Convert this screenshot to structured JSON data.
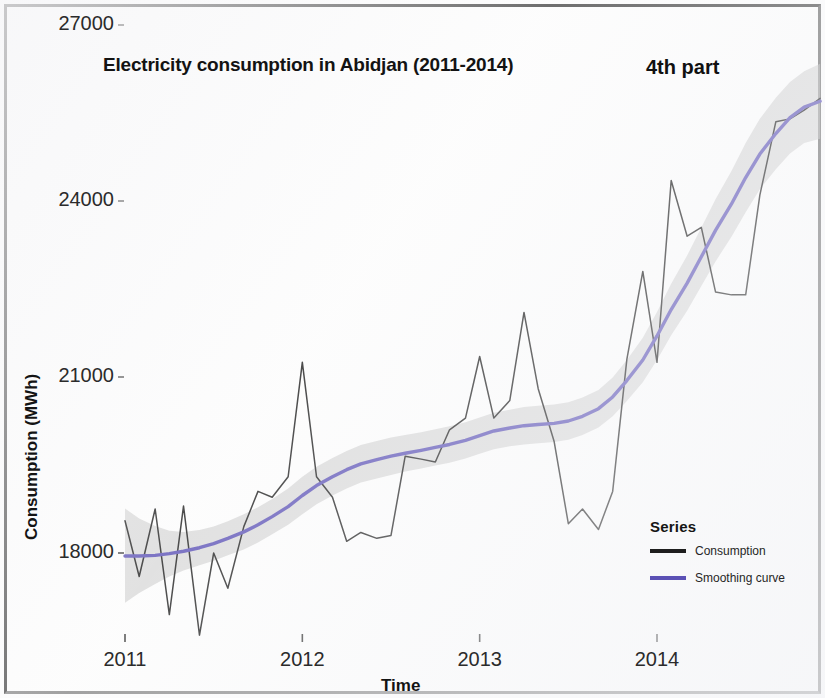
{
  "chart_data": {
    "type": "line",
    "title": "Electricity consumption in Abidjan (2011-2014)",
    "annotation": "4th part",
    "xlabel": "Time",
    "ylabel": "Consumption (MWh)",
    "xlim": [
      2011.0,
      2014.95
    ],
    "ylim": [
      16800,
      27000
    ],
    "xticks": [
      2011,
      2012,
      2013,
      2014
    ],
    "xtick_labels": [
      "2011",
      "2012",
      "2013",
      "2014"
    ],
    "yticks": [
      18000,
      21000,
      24000,
      27000
    ],
    "ytick_labels": [
      "18000",
      "21000",
      "24000",
      "27000"
    ],
    "grid": false,
    "legend": {
      "title": "Series",
      "position": "bottom-right",
      "entries": [
        {
          "label": "Consumption",
          "color": "#1e1e1e"
        },
        {
          "label": "Smoothing curve",
          "color": "#5b51b5"
        }
      ]
    },
    "confidence_band": {
      "label": "smoothing confidence interval",
      "color": "#bdbdbd",
      "opacity": 0.55
    },
    "x": [
      2011.0,
      2011.08,
      2011.17,
      2011.25,
      2011.33,
      2011.42,
      2011.5,
      2011.58,
      2011.67,
      2011.75,
      2011.83,
      2011.92,
      2012.0,
      2012.08,
      2012.17,
      2012.25,
      2012.33,
      2012.42,
      2012.5,
      2012.58,
      2012.67,
      2012.75,
      2012.83,
      2012.92,
      2013.0,
      2013.08,
      2013.17,
      2013.25,
      2013.33,
      2013.42,
      2013.5,
      2013.58,
      2013.67,
      2013.75,
      2013.83,
      2013.92,
      2014.0,
      2014.08,
      2014.17,
      2014.25,
      2014.33,
      2014.42,
      2014.5,
      2014.58,
      2014.67,
      2014.75,
      2014.83,
      2014.92
    ],
    "series": [
      {
        "name": "Consumption",
        "color": "#1e1e1e",
        "values": [
          18550,
          17600,
          18750,
          16950,
          18800,
          16600,
          18000,
          17400,
          18450,
          19050,
          18950,
          19300,
          21250,
          19300,
          18950,
          18200,
          18350,
          18250,
          18300,
          19650,
          19600,
          19550,
          20100,
          20300,
          21350,
          20300,
          20600,
          22100,
          20800,
          19900,
          18500,
          18750,
          18400,
          19050,
          21300,
          22800,
          21250,
          24350,
          23400,
          23550,
          22450,
          22400,
          22400,
          24100,
          25350,
          25400,
          25550,
          25750
        ]
      },
      {
        "name": "Smoothing curve",
        "color": "#5b51b5",
        "values": [
          17950,
          17950,
          17960,
          17990,
          18030,
          18090,
          18160,
          18250,
          18360,
          18480,
          18620,
          18790,
          18980,
          19150,
          19300,
          19420,
          19520,
          19590,
          19650,
          19700,
          19750,
          19800,
          19850,
          19920,
          20000,
          20080,
          20130,
          20170,
          20190,
          20210,
          20250,
          20330,
          20460,
          20660,
          20940,
          21290,
          21700,
          22150,
          22600,
          23050,
          23500,
          23950,
          24400,
          24800,
          25150,
          25420,
          25600,
          25700
        ]
      }
    ],
    "band": {
      "name": "confidence interval",
      "lower": [
        17150,
        17320,
        17470,
        17600,
        17700,
        17790,
        17870,
        17960,
        18060,
        18180,
        18320,
        18480,
        18660,
        18830,
        18980,
        19100,
        19200,
        19270,
        19330,
        19390,
        19440,
        19490,
        19540,
        19610,
        19690,
        19770,
        19820,
        19850,
        19870,
        19890,
        19930,
        20010,
        20140,
        20330,
        20590,
        20910,
        21290,
        21710,
        22130,
        22550,
        22970,
        23390,
        23810,
        24200,
        24540,
        24810,
        24990,
        25060
      ],
      "upper": [
        18760,
        18590,
        18460,
        18380,
        18360,
        18390,
        18450,
        18540,
        18660,
        18780,
        18920,
        19100,
        19300,
        19470,
        19620,
        19740,
        19840,
        19910,
        19970,
        20010,
        20060,
        20110,
        20160,
        20230,
        20310,
        20390,
        20440,
        20490,
        20510,
        20530,
        20570,
        20650,
        20780,
        20990,
        21290,
        21670,
        22110,
        22590,
        23070,
        23550,
        24030,
        24510,
        24990,
        25400,
        25760,
        26030,
        26210,
        26340
      ]
    }
  }
}
